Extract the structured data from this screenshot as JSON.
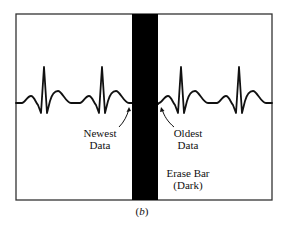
{
  "figure": {
    "caption_letter": "b",
    "caption_open": "(",
    "caption_close": ")",
    "colors": {
      "background": "#ffffff",
      "frame": "#333333",
      "trace": "#111111",
      "erase_bar": "#000000"
    },
    "frame": {
      "x": 16,
      "y": 14,
      "width": 256,
      "height": 186
    },
    "erase_bar": {
      "x": 132,
      "y": 14,
      "width": 26,
      "height": 186
    },
    "waveform": {
      "baseline_y": 103,
      "left_peaks_x": [
        44,
        102
      ],
      "right_peaks_x": [
        181,
        239
      ]
    },
    "labels": {
      "newest_line1": "Newest",
      "newest_line2": "Data",
      "oldest_line1": "Oldest",
      "oldest_line2": "Data",
      "erase_line1": "Erase Bar",
      "erase_line2": "(Dark)"
    }
  }
}
